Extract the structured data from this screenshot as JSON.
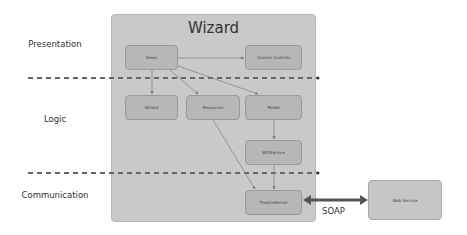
{
  "frame": {
    "title": "Wizard"
  },
  "layers": [
    {
      "label": "Presentation",
      "y": 42
    },
    {
      "label": "Logic",
      "y": 117
    },
    {
      "label": "Communication",
      "y": 193
    }
  ],
  "boxes": {
    "views": "Views",
    "custom_controls": "Custom Controls",
    "wizard": "Wizard",
    "resources": "Resources",
    "model": "Model",
    "wifi_service": "WifiService",
    "theatre_server": "TheatreServer",
    "web_service": "Web Service"
  },
  "connector": {
    "label": "SOAP"
  },
  "colors": {
    "frame": "#c9c9c9",
    "box": "#b7b7b7",
    "dashed": "#666666",
    "arrow": "#444444"
  }
}
